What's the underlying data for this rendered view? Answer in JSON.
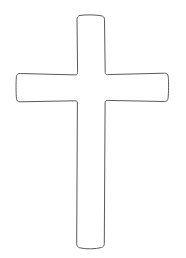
{
  "canvas": {
    "width": 186,
    "height": 258,
    "background_color": "#ffffff",
    "title": "Cross Outline"
  },
  "figure": {
    "name": "latin-cross-outline",
    "stroke_color": "#5a5a5a",
    "fill_color": "#ffffff",
    "stroke_width": 1,
    "style": "hand-drawn-outline",
    "geometry": {
      "top_y": 15,
      "bottom_y": 249,
      "left_arm_x": 17,
      "right_arm_x": 169,
      "arm_top_y": 74,
      "arm_bottom_y": 102,
      "shaft_left_x": 77,
      "shaft_right_x": 105,
      "shaft_width": 28,
      "arm_height": 28
    },
    "path": "M 79.5 15.5 C 85 14.6 95 14.6 101.5 15.8 C 103.4 16.2 104.4 17.3 104.5 19.2 L 105.2 72.6 C 105.3 74.1 106.1 74.8 107.6 74.6 L 164.3 73.2 C 166.6 73.1 167.9 74.2 168.2 76.3 C 168.8 81.6 168.7 92.6 168.0 98.6 C 167.8 100.6 166.5 101.6 164.3 101.5 L 107.2 100.4 C 105.8 100.4 105.1 101.2 105.1 102.7 L 104.3 243.4 C 104.3 245.6 103.4 246.9 101.4 247.5 C 95.6 249.2 85.6 249.3 79.8 247.8 C 77.7 247.2 76.7 245.9 76.7 243.7 L 77.4 103.0 C 77.4 101.5 76.7 100.8 75.2 100.8 L 20.2 101.8 C 18.0 101.9 16.7 100.8 16.5 98.7 C 15.9 92.8 15.9 81.9 16.4 76.6 C 16.6 74.5 17.9 73.4 20.1 73.5 L 75.3 74.9 C 76.8 74.9 77.6 74.2 77.6 72.7 L 77.0 19.4 C 77.0 17.4 77.7 16.3 79.5 15.5 Z"
  }
}
